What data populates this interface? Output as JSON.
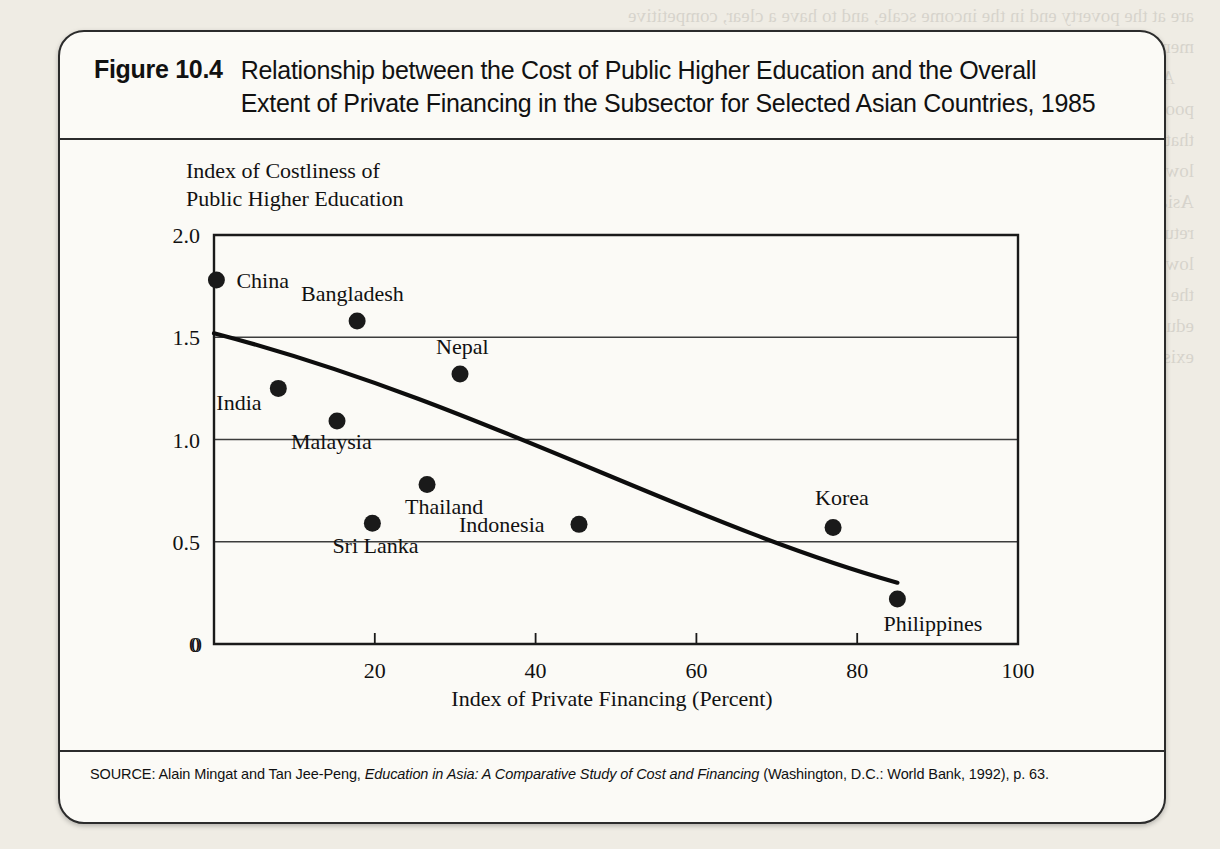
{
  "figure": {
    "number": "Figure 10.4",
    "title_line1": "Relationship between the Cost of Public Higher Education and the Overall",
    "title_line2": "Extent of Private Financing in the Subsector for Selected Asian Countries, 1985"
  },
  "source": {
    "prefix": "SOURCE: Alain Mingat and Tan Jee-Peng, ",
    "italic": "Education in Asia: A Comparative Study of Cost and Financing",
    "suffix": " (Washington, D.C.: World Bank, 1992), p. 63."
  },
  "chart_data": {
    "type": "scatter",
    "title": "Relationship between the Cost of Public Higher Education and the Overall Extent of Private Financing in the Subsector for Selected Asian Countries, 1985",
    "xlabel": "Index of Private Financing (Percent)",
    "ylabel_line1": "Index of Costliness of",
    "ylabel_line2": "Public Higher Education",
    "xlim": [
      0,
      100
    ],
    "ylim": [
      0,
      2.0
    ],
    "xticks": [
      "0",
      "20",
      "40",
      "60",
      "80",
      "100"
    ],
    "xtick_values": [
      0,
      20,
      40,
      60,
      80,
      100
    ],
    "yticks": [
      "0",
      "0.5",
      "1.0",
      "1.5",
      "2.0"
    ],
    "ytick_values": [
      0,
      0.5,
      1.0,
      1.5,
      2.0
    ],
    "grid": "horizontal",
    "legend": "none",
    "points": [
      {
        "name": "China",
        "x": 0.3,
        "y": 1.78,
        "label_dx": 20,
        "label_dy": 8
      },
      {
        "name": "Bangladesh",
        "x": 17.8,
        "y": 1.58,
        "label_dx": -56,
        "label_dy": -20
      },
      {
        "name": "Nepal",
        "x": 30.6,
        "y": 1.32,
        "label_dx": -24,
        "label_dy": -20
      },
      {
        "name": "India",
        "x": 8.0,
        "y": 1.25,
        "label_dx": -62,
        "label_dy": 22
      },
      {
        "name": "Malaysia",
        "x": 15.3,
        "y": 1.09,
        "label_dx": -46,
        "label_dy": 28
      },
      {
        "name": "Thailand",
        "x": 26.5,
        "y": 0.78,
        "label_dx": -22,
        "label_dy": 30
      },
      {
        "name": "Sri Lanka",
        "x": 19.7,
        "y": 0.59,
        "label_dx": -40,
        "label_dy": 30
      },
      {
        "name": "Indonesia",
        "x": 45.4,
        "y": 0.585,
        "label_dx": -120,
        "label_dy": 8
      },
      {
        "name": "Korea",
        "x": 77.0,
        "y": 0.57,
        "label_dx": -18,
        "label_dy": -22
      },
      {
        "name": "Philippines",
        "x": 85.0,
        "y": 0.22,
        "label_dx": -14,
        "label_dy": 32
      }
    ],
    "trend_curve": {
      "description": "downward-sloping fitted curve",
      "start": {
        "x": 0,
        "y": 1.52
      },
      "control1": {
        "x": 33,
        "y": 1.18
      },
      "control2": {
        "x": 58,
        "y": 0.6
      },
      "end": {
        "x": 85,
        "y": 0.3
      }
    }
  },
  "colors": {
    "ink": "#1a1a1a",
    "paper": "#fbfaf6",
    "page": "#efece4",
    "grid": "#3c3c3c"
  }
}
